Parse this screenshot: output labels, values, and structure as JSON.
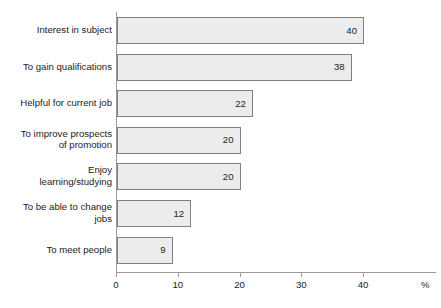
{
  "chart_data": {
    "type": "bar",
    "orientation": "horizontal",
    "title": "",
    "subtitle": "",
    "xlabel": "%",
    "ylabel": "",
    "categories": [
      "Interest in subject",
      "To gain qualifications",
      "Helpful for current job",
      "To improve prospects\nof promotion",
      "Enjoy\nlearning/studying",
      "To be able to change\njobs",
      "To meet people"
    ],
    "values": [
      40,
      38,
      22,
      20,
      20,
      12,
      9
    ],
    "value_labels": [
      "40",
      "38",
      "22",
      "20",
      "20",
      "12",
      "9"
    ],
    "xlim": [
      0,
      48
    ],
    "xticks": [
      0,
      10,
      20,
      30,
      40
    ],
    "xtick_labels": [
      "0",
      "10",
      "20",
      "30",
      "40"
    ],
    "grid": false,
    "legend": null,
    "colors": {
      "bar_fill": "#ececec",
      "bar_border": "#808080",
      "axis": "#9a9a9a",
      "text": "#1c1c1c",
      "background": "#ffffff"
    }
  },
  "axis": {
    "unit_label": "%"
  }
}
